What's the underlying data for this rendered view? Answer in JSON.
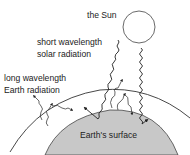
{
  "diagram": {
    "labels": {
      "sun": "the Sun",
      "solar_line1": "short wavelength",
      "solar_line2": "solar radiation",
      "earth_rad_line1": "long wavelength",
      "earth_rad_line2": "Earth radiation",
      "surface": "Earth's surface"
    },
    "colors": {
      "earth_fill": "#c8c8c8",
      "stroke": "#333333",
      "background": "#ffffff"
    }
  }
}
